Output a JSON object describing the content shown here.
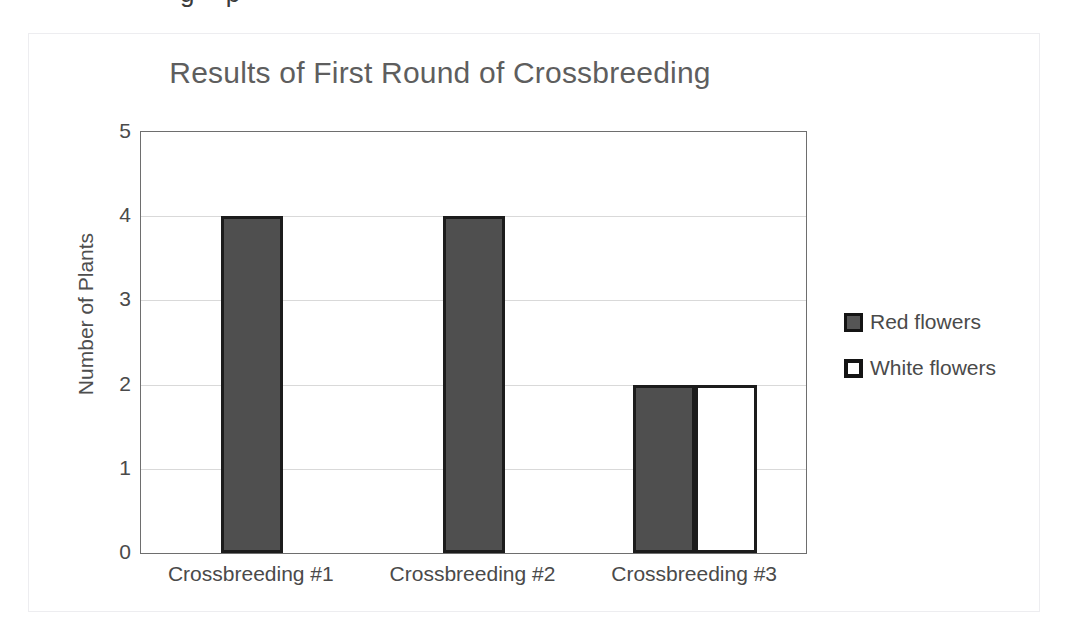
{
  "scan": {
    "clipped_text_above": "g p"
  },
  "chart_data": {
    "type": "bar",
    "title": "Results of First Round of Crossbreeding",
    "xlabel": "",
    "ylabel": "Number of Plants",
    "categories": [
      "Crossbreeding #1",
      "Crossbreeding #2",
      "Crossbreeding #3"
    ],
    "series": [
      {
        "name": "Red flowers",
        "values": [
          4,
          4,
          2
        ],
        "color": "#4f4f4f"
      },
      {
        "name": "White flowers",
        "values": [
          null,
          null,
          2
        ],
        "color": "#ffffff"
      }
    ],
    "ylim": [
      0,
      5
    ],
    "ytick_labels": [
      "5",
      "4",
      "3",
      "2",
      "1",
      "0"
    ],
    "ytick_values": [
      5,
      4,
      3,
      2,
      1,
      0
    ],
    "gridlines": [
      1,
      2,
      3,
      4
    ],
    "grid": true,
    "legend_position": "right",
    "legend": [
      {
        "label": "Red flowers",
        "swatch": "filled-dark"
      },
      {
        "label": "White flowers",
        "swatch": "outlined-white"
      }
    ],
    "colors": {
      "title": "#5e5e5e",
      "tick_text": "#4a4a4a",
      "bar_fill_red": "#4f4f4f",
      "bar_fill_white": "#ffffff",
      "bar_border": "#1c1c1c",
      "gridline": "#d9d9d9",
      "plot_border": "#6e6e6e",
      "card_border": "#ededf0"
    }
  }
}
